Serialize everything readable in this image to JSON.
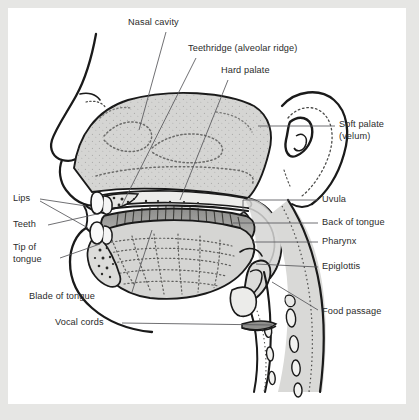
{
  "figure": {
    "kind": "anatomical-diagram",
    "background_color": "#ffffff",
    "frame_color": "#e6e6e4",
    "tissue_fill": "#d5d5d3",
    "outline_color": "#1a1a1a",
    "label_color": "#2b2b2b",
    "leader_color": "#4a4a4a"
  },
  "labels": {
    "nasal_cavity": "Nasal cavity",
    "teethridge": "Teethridge (alveolar ridge)",
    "hard_palate": "Hard palate",
    "soft_palate_l1": "Soft palate",
    "soft_palate_l2": "(velum)",
    "uvula": "Uvula",
    "back_of_tongue": "Back of tongue",
    "pharynx": "Pharynx",
    "epiglottis": "Epiglottis",
    "food_passage": "Food passage",
    "lips": "Lips",
    "teeth": "Teeth",
    "tip_of_tongue_l1": "Tip of",
    "tip_of_tongue_l2": "tongue",
    "blade_of_tongue": "Blade of tongue",
    "vocal_cords": "Vocal cords"
  },
  "parts": [
    {
      "id": "nasal-cavity",
      "label": "Nasal cavity",
      "side": "top"
    },
    {
      "id": "teethridge",
      "label": "Teethridge (alveolar ridge)",
      "side": "top"
    },
    {
      "id": "hard-palate",
      "label": "Hard palate",
      "side": "top"
    },
    {
      "id": "soft-palate",
      "label": "Soft palate (velum)",
      "side": "right"
    },
    {
      "id": "uvula",
      "label": "Uvula",
      "side": "right"
    },
    {
      "id": "back-of-tongue",
      "label": "Back of tongue",
      "side": "right"
    },
    {
      "id": "pharynx",
      "label": "Pharynx",
      "side": "right"
    },
    {
      "id": "epiglottis",
      "label": "Epiglottis",
      "side": "right"
    },
    {
      "id": "food-passage",
      "label": "Food passage",
      "side": "right"
    },
    {
      "id": "lips",
      "label": "Lips",
      "side": "left"
    },
    {
      "id": "teeth",
      "label": "Teeth",
      "side": "left"
    },
    {
      "id": "tip-of-tongue",
      "label": "Tip of tongue",
      "side": "left"
    },
    {
      "id": "blade-of-tongue",
      "label": "Blade of tongue",
      "side": "left"
    },
    {
      "id": "vocal-cords",
      "label": "Vocal cords",
      "side": "left"
    }
  ]
}
